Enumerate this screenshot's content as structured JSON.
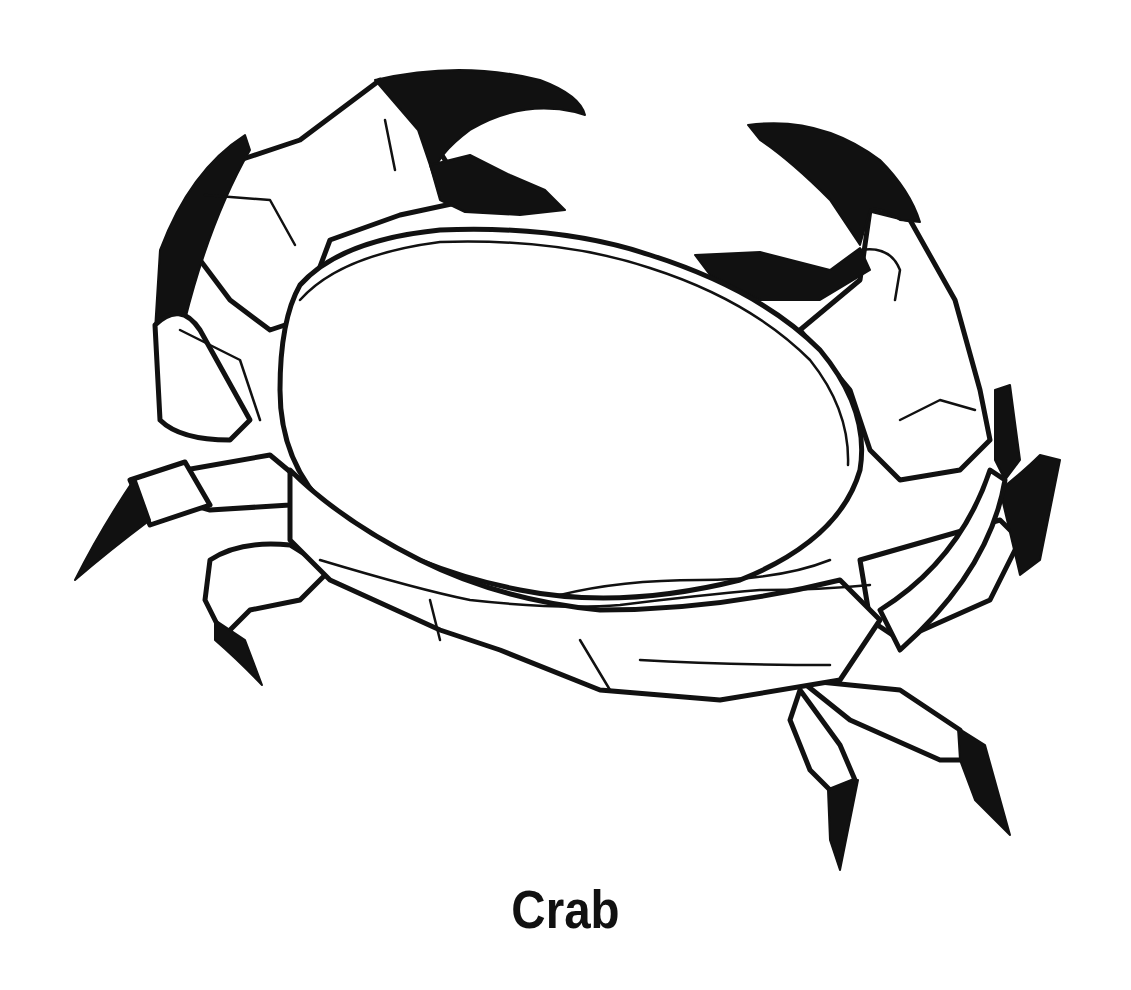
{
  "illustration": {
    "subject": "crab",
    "style": "black-and-white line art",
    "colors": {
      "ink": "#111111",
      "background": "#ffffff"
    }
  },
  "caption": {
    "text": "Crab"
  }
}
